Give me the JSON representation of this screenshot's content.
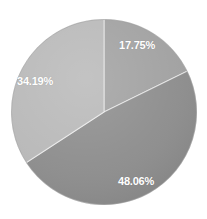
{
  "chart_data": {
    "type": "pie",
    "title": "",
    "subtitle": "",
    "xlabel": "",
    "ylabel": "",
    "grid": false,
    "legend": "none",
    "background_color": "#FFFFFF",
    "start_angle_deg": 0,
    "direction": "clockwise",
    "center": {
      "x": 104,
      "y": 112
    },
    "radius": 93,
    "categories": [
      "Slice 1",
      "Slice 2",
      "Slice 3"
    ],
    "values": [
      17.75,
      48.06,
      34.19
    ],
    "labels": [
      "17.75%",
      "48.06%",
      "34.19%"
    ],
    "colors": [
      "#A0A0A0",
      "#8C8C8C",
      "#B8B8B8"
    ],
    "label_color": "#FFFFFF",
    "slices": [
      {
        "label": "17.75%",
        "value": 17.75,
        "color": "#A0A0A0",
        "start_angle_deg": 0,
        "end_angle_deg": 63.9,
        "label_x": 119,
        "label_y": 40
      },
      {
        "label": "48.06%",
        "value": 48.06,
        "color": "#8C8C8C",
        "start_angle_deg": 63.9,
        "end_angle_deg": 236.9,
        "label_x": 118,
        "label_y": 176
      },
      {
        "label": "34.19%",
        "value": 34.19,
        "color": "#B8B8B8",
        "start_angle_deg": 236.9,
        "end_angle_deg": 360,
        "label_x": 17,
        "label_y": 76
      }
    ]
  }
}
